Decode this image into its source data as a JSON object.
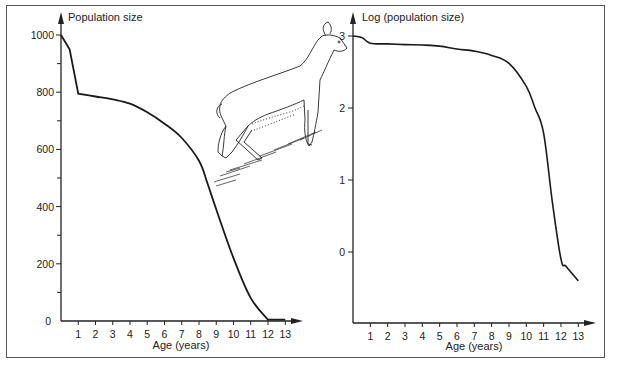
{
  "figure": {
    "caption": ""
  },
  "chart_data": [
    {
      "type": "line",
      "title": "",
      "ylabel": "Population size",
      "xlabel": "Age (years)",
      "x_ticks": [
        1,
        2,
        3,
        4,
        5,
        6,
        7,
        8,
        9,
        10,
        11,
        12,
        13
      ],
      "y_ticks": [
        0,
        200,
        400,
        600,
        800,
        1000
      ],
      "y_minor_ticks": [
        100,
        300,
        500,
        700,
        900
      ],
      "ylim": [
        0,
        1000
      ],
      "xlim": [
        0,
        13
      ],
      "grid": false,
      "legend": null,
      "series": [
        {
          "name": "Population size",
          "x": [
            0,
            0.5,
            1,
            2,
            3,
            4,
            5,
            6,
            7,
            8,
            8.5,
            9,
            10,
            11,
            12,
            12.5,
            13
          ],
          "y": [
            1000,
            950,
            795,
            785,
            775,
            760,
            730,
            690,
            640,
            560,
            480,
            390,
            220,
            80,
            5,
            5,
            5
          ]
        }
      ]
    },
    {
      "type": "line",
      "title": "",
      "ylabel": "Log (population size)",
      "xlabel": "Age (years)",
      "x_ticks": [
        1,
        2,
        3,
        4,
        5,
        6,
        7,
        8,
        9,
        10,
        11,
        12,
        13
      ],
      "y_ticks": [
        0,
        1,
        2,
        3
      ],
      "ylim": [
        -0.9,
        3
      ],
      "xlim": [
        0,
        13
      ],
      "grid": false,
      "legend": null,
      "series": [
        {
          "name": "Log (population size)",
          "x": [
            0,
            0.5,
            1,
            2,
            3,
            4,
            5,
            6,
            7,
            8,
            9,
            10,
            10.5,
            11,
            11.5,
            12,
            12.3,
            13
          ],
          "y": [
            3.0,
            2.98,
            2.9,
            2.89,
            2.88,
            2.875,
            2.86,
            2.82,
            2.79,
            2.73,
            2.62,
            2.3,
            2.0,
            1.65,
            0.7,
            -0.1,
            -0.2,
            -0.4
          ]
        }
      ]
    }
  ]
}
